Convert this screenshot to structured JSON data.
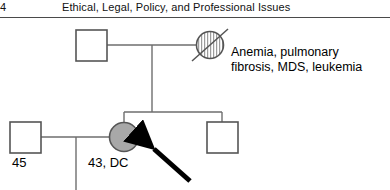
{
  "page": {
    "width": 390,
    "height": 190,
    "background": "#ffffff"
  },
  "running_head": {
    "folio": "4",
    "title": "Ethical, Legal, Policy, and Professional Issues",
    "rule_color": "#4a4a4a"
  },
  "figure": {
    "type": "pedigree-chart",
    "line_color": "#6e6e6e",
    "symbol_stroke": "#555555",
    "affected_fill": "#a8a8a8",
    "hatch_color": "#777777",
    "arrow_color": "#000000",
    "annotations": [
      {
        "id": "grandmother-conditions",
        "text_line_1": "Anemia, pulmonary",
        "text_line_2": "fibrosis, MDS, leukemia"
      }
    ],
    "individuals": [
      {
        "id": "generation1-male",
        "sex": "male",
        "symbol": "square",
        "status": "unaffected",
        "label": "",
        "cx": 91,
        "cy": 45
      },
      {
        "id": "generation1-female",
        "sex": "female",
        "symbol": "circle",
        "status": "affected-deceased",
        "fill_pattern": "hatched",
        "deceased_slash": true,
        "label": "",
        "cx": 210,
        "cy": 45
      },
      {
        "id": "generation2-daughter-proband",
        "sex": "female",
        "symbol": "circle",
        "status": "affected",
        "fill_pattern": "solid-gray",
        "label": "43, DC",
        "proband_arrow": true,
        "cx": 124,
        "cy": 137
      },
      {
        "id": "generation2-son",
        "sex": "male",
        "symbol": "square",
        "status": "unaffected",
        "label": "",
        "cx": 222,
        "cy": 137
      },
      {
        "id": "generation2-spouse-male",
        "sex": "male",
        "symbol": "square",
        "status": "unaffected",
        "label": "45",
        "cx": 25,
        "cy": 137
      }
    ],
    "labels": {
      "spouse_age": "45",
      "proband_age_dx": "43, DC"
    }
  }
}
